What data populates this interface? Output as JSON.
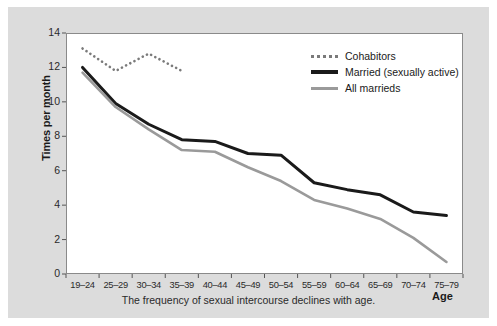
{
  "chart_data": {
    "type": "line",
    "title": "",
    "xlabel": "Age",
    "ylabel": "Times per month",
    "ylim": [
      0,
      14
    ],
    "ytick_values": [
      0,
      2,
      4,
      6,
      8,
      10,
      12,
      14
    ],
    "ytick_labels": [
      "0",
      "2",
      "4",
      "6",
      "8",
      "10",
      "12",
      "14"
    ],
    "grid": false,
    "legend_position": "upper right",
    "categories": [
      "19-24",
      "25-29",
      "30-34",
      "35-39",
      "40-44",
      "45-49",
      "50-54",
      "55-59",
      "60-64",
      "65-69",
      "70-74",
      "75-79"
    ],
    "series": [
      {
        "name": "Cohabitors",
        "style": "dotted",
        "color": "#7a7a7a",
        "values": [
          13.1,
          11.8,
          12.8,
          11.8,
          null,
          null,
          null,
          null,
          null,
          null,
          null,
          null
        ]
      },
      {
        "name": "Married (sexually active)",
        "style": "solid",
        "color": "#1a1a1a",
        "values": [
          12.0,
          9.9,
          8.7,
          7.8,
          7.7,
          7.0,
          6.9,
          5.3,
          4.9,
          4.6,
          3.6,
          3.4
        ]
      },
      {
        "name": "All marrieds",
        "style": "solid",
        "color": "#9a9a9a",
        "values": [
          11.7,
          9.7,
          8.4,
          7.2,
          7.1,
          6.2,
          5.4,
          4.3,
          3.8,
          3.2,
          2.1,
          0.7
        ]
      }
    ],
    "caption": "The frequency of sexual intercourse declines with age."
  },
  "legend": {
    "items": [
      {
        "label": "Cohabitors",
        "swatch": "dotted-line-swatch"
      },
      {
        "label": "Married (sexually active)",
        "swatch": "solid-black-line-swatch"
      },
      {
        "label": "All marrieds",
        "swatch": "solid-gray-line-swatch"
      }
    ]
  }
}
